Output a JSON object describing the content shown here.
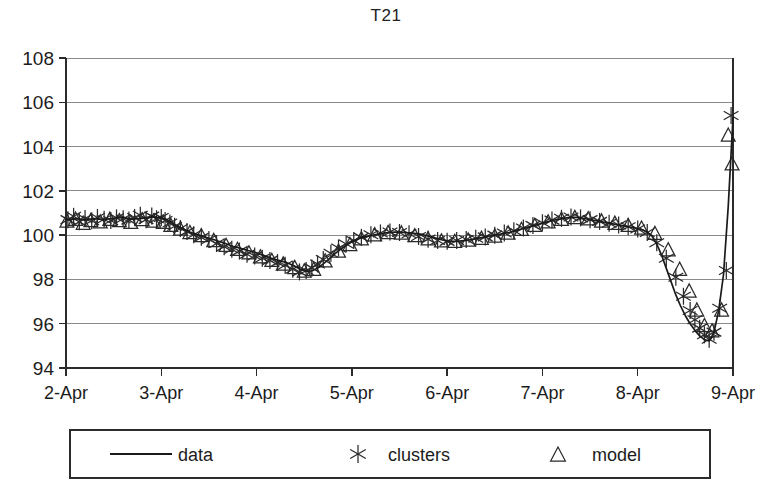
{
  "chart_data": {
    "type": "line",
    "title": "T21",
    "xlabel": "",
    "ylabel": "",
    "grid": true,
    "legend_position": "bottom",
    "ylim": [
      94,
      108
    ],
    "yticks": [
      94,
      96,
      98,
      100,
      102,
      104,
      106,
      108
    ],
    "xlim": [
      "2-Apr",
      "9-Apr"
    ],
    "xticks": [
      "2-Apr",
      "3-Apr",
      "4-Apr",
      "5-Apr",
      "6-Apr",
      "7-Apr",
      "8-Apr",
      "9-Apr"
    ],
    "series": [
      {
        "name": "data",
        "style": "line",
        "x": [
          0.0,
          0.05,
          0.1,
          0.15,
          0.2,
          0.25,
          0.3,
          0.35,
          0.4,
          0.45,
          0.5,
          0.55,
          0.6,
          0.65,
          0.7,
          0.75,
          0.8,
          0.85,
          0.9,
          0.95,
          1.0,
          1.05,
          1.1,
          1.15,
          1.2,
          1.25,
          1.3,
          1.35,
          1.4,
          1.45,
          1.5,
          1.55,
          1.6,
          1.65,
          1.7,
          1.75,
          1.8,
          1.85,
          1.9,
          1.95,
          2.0,
          2.05,
          2.1,
          2.15,
          2.2,
          2.25,
          2.3,
          2.35,
          2.4,
          2.45,
          2.5,
          2.55,
          2.6,
          2.65,
          2.7,
          2.75,
          2.8,
          2.85,
          2.9,
          2.95,
          3.0,
          3.05,
          3.1,
          3.15,
          3.2,
          3.25,
          3.3,
          3.35,
          3.4,
          3.45,
          3.5,
          3.55,
          3.6,
          3.65,
          3.7,
          3.75,
          3.8,
          3.85,
          3.9,
          3.95,
          4.0,
          4.05,
          4.1,
          4.15,
          4.2,
          4.25,
          4.3,
          4.35,
          4.4,
          4.45,
          4.5,
          4.55,
          4.6,
          4.65,
          4.7,
          4.75,
          4.8,
          4.85,
          4.9,
          4.95,
          5.0,
          5.05,
          5.1,
          5.15,
          5.2,
          5.25,
          5.3,
          5.35,
          5.4,
          5.45,
          5.5,
          5.55,
          5.6,
          5.65,
          5.7,
          5.75,
          5.8,
          5.85,
          5.9,
          5.95,
          6.0,
          6.05,
          6.1,
          6.15,
          6.2,
          6.25,
          6.3,
          6.35,
          6.4,
          6.45,
          6.5,
          6.55,
          6.6,
          6.65,
          6.7,
          6.75,
          6.8,
          6.85,
          6.9,
          6.95,
          7.0
        ],
        "y": [
          100.72,
          100.7,
          100.74,
          100.72,
          100.68,
          100.72,
          100.75,
          100.72,
          100.7,
          100.74,
          100.76,
          100.78,
          100.8,
          100.76,
          100.72,
          100.74,
          100.76,
          100.8,
          100.84,
          100.8,
          100.78,
          100.72,
          100.6,
          100.46,
          100.34,
          100.24,
          100.14,
          100.06,
          100.0,
          99.92,
          99.86,
          99.8,
          99.72,
          99.66,
          99.58,
          99.5,
          99.44,
          99.38,
          99.32,
          99.26,
          99.2,
          99.12,
          99.04,
          98.96,
          98.9,
          98.84,
          98.78,
          98.7,
          98.6,
          98.48,
          98.4,
          98.36,
          98.42,
          98.54,
          98.7,
          98.88,
          99.08,
          99.26,
          99.42,
          99.56,
          99.7,
          99.8,
          99.88,
          99.94,
          99.98,
          100.02,
          100.06,
          100.1,
          100.12,
          100.14,
          100.14,
          100.12,
          100.1,
          100.08,
          100.06,
          100.02,
          99.96,
          99.9,
          99.84,
          99.78,
          99.74,
          99.72,
          99.72,
          99.74,
          99.76,
          99.8,
          99.84,
          99.88,
          99.92,
          99.96,
          100.0,
          100.04,
          100.08,
          100.12,
          100.18,
          100.24,
          100.3,
          100.36,
          100.42,
          100.48,
          100.54,
          100.6,
          100.66,
          100.7,
          100.74,
          100.78,
          100.8,
          100.8,
          100.78,
          100.74,
          100.7,
          100.66,
          100.62,
          100.58,
          100.54,
          100.5,
          100.46,
          100.42,
          100.38,
          100.34,
          100.3,
          100.24,
          100.14,
          99.96,
          99.6,
          99.1,
          98.5,
          97.9,
          97.3,
          96.8,
          96.36,
          96.0,
          95.7,
          95.45,
          95.28,
          95.22,
          95.6,
          96.6,
          98.2,
          101.3,
          105.3
        ],
        "description": "Measured data series, continuous line. Starts near 100.7, dips to ~98.4 around 4-Apr, plateaus near 100 through 5-Apr to 7-Apr, peaks ~100.8 near 7-Apr, then drops sharply to a minimum of ~95.2 just before 9-Apr and rises steeply to ~105.3."
      },
      {
        "name": "clusters",
        "style": "marker-asterisk",
        "x": [
          0.02,
          0.08,
          0.14,
          0.2,
          0.27,
          0.33,
          0.4,
          0.47,
          0.53,
          0.6,
          0.66,
          0.72,
          0.78,
          0.84,
          0.9,
          0.95,
          1.0,
          1.04,
          1.09,
          1.14,
          1.2,
          1.27,
          1.34,
          1.42,
          1.5,
          1.58,
          1.66,
          1.74,
          1.82,
          1.9,
          1.98,
          2.06,
          2.14,
          2.22,
          2.3,
          2.38,
          2.45,
          2.52,
          2.58,
          2.64,
          2.7,
          2.78,
          2.86,
          2.94,
          3.02,
          3.1,
          3.2,
          3.3,
          3.4,
          3.5,
          3.6,
          3.7,
          3.8,
          3.9,
          4.0,
          4.1,
          4.2,
          4.3,
          4.4,
          4.5,
          4.6,
          4.7,
          4.8,
          4.9,
          5.0,
          5.1,
          5.2,
          5.3,
          5.4,
          5.5,
          5.6,
          5.7,
          5.8,
          5.9,
          6.0,
          6.1,
          6.2,
          6.3,
          6.4,
          6.48,
          6.55,
          6.6,
          6.65,
          6.7,
          6.75,
          6.8,
          6.86,
          6.93,
          6.98
        ],
        "y": [
          100.7,
          100.85,
          100.6,
          100.75,
          100.65,
          100.8,
          100.72,
          100.66,
          100.78,
          100.74,
          100.68,
          100.8,
          100.9,
          100.7,
          100.86,
          100.74,
          100.8,
          100.66,
          100.55,
          100.4,
          100.3,
          100.16,
          100.02,
          99.9,
          99.8,
          99.62,
          99.48,
          99.36,
          99.28,
          99.14,
          99.06,
          98.96,
          98.86,
          98.76,
          98.64,
          98.46,
          98.34,
          98.4,
          98.52,
          98.7,
          98.9,
          99.18,
          99.42,
          99.6,
          99.76,
          99.9,
          100.02,
          100.1,
          100.14,
          100.12,
          100.06,
          99.94,
          99.82,
          99.76,
          99.72,
          99.76,
          99.8,
          99.86,
          99.92,
          100.0,
          100.1,
          100.2,
          100.32,
          100.44,
          100.56,
          100.68,
          100.76,
          100.82,
          100.78,
          100.7,
          100.62,
          100.54,
          100.46,
          100.38,
          100.28,
          100.12,
          99.66,
          98.96,
          98.1,
          97.24,
          96.6,
          96.18,
          95.8,
          95.5,
          95.3,
          95.62,
          96.7,
          98.4,
          105.4
        ],
        "description": "Cluster centres marked with asterisk/X glyphs, tracking the data line closely."
      },
      {
        "name": "model",
        "style": "marker-triangle",
        "x": [
          0.01,
          0.1,
          0.18,
          0.26,
          0.36,
          0.46,
          0.56,
          0.68,
          0.8,
          0.92,
          1.02,
          1.1,
          1.2,
          1.3,
          1.42,
          1.55,
          1.68,
          1.8,
          1.92,
          2.04,
          2.16,
          2.28,
          2.4,
          2.5,
          2.6,
          2.72,
          2.86,
          2.98,
          3.1,
          3.24,
          3.38,
          3.52,
          3.66,
          3.8,
          3.94,
          4.08,
          4.22,
          4.36,
          4.5,
          4.64,
          4.78,
          4.92,
          5.06,
          5.2,
          5.34,
          5.48,
          5.62,
          5.76,
          5.9,
          6.04,
          6.18,
          6.32,
          6.44,
          6.54,
          6.62,
          6.7,
          6.78,
          6.88,
          6.95,
          6.99
        ],
        "y": [
          100.62,
          100.7,
          100.52,
          100.64,
          100.58,
          100.7,
          100.64,
          100.56,
          100.68,
          100.62,
          100.56,
          100.42,
          100.26,
          100.1,
          99.96,
          99.74,
          99.52,
          99.34,
          99.18,
          99.0,
          98.84,
          98.68,
          98.52,
          98.36,
          98.44,
          98.82,
          99.26,
          99.56,
          99.82,
          100.0,
          100.1,
          100.08,
          99.96,
          99.82,
          99.72,
          99.7,
          99.76,
          99.84,
          99.94,
          100.08,
          100.24,
          100.42,
          100.58,
          100.7,
          100.78,
          100.72,
          100.62,
          100.52,
          100.42,
          100.3,
          100.06,
          99.32,
          98.44,
          97.46,
          96.6,
          95.9,
          95.66,
          96.6,
          104.5,
          103.2
        ],
        "description": "Model predictions drawn as open triangles, slightly offset below the data line in places."
      }
    ],
    "axis": {
      "plot_left": 66,
      "plot_right": 733,
      "plot_top": 58,
      "plot_bottom": 368
    }
  },
  "legend": {
    "entries": [
      {
        "label": "data",
        "marker": "line-icon"
      },
      {
        "label": "clusters",
        "marker": "asterisk-icon"
      },
      {
        "label": "model",
        "marker": "triangle-icon"
      }
    ]
  }
}
